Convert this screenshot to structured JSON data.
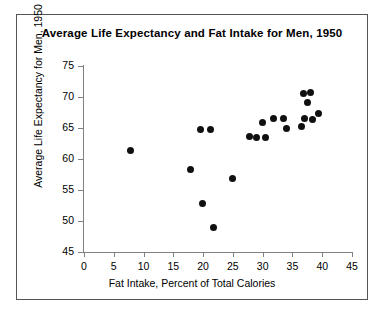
{
  "chart_data": {
    "type": "scatter",
    "title": "Average Life Expectancy and Fat Intake for Men, 1950",
    "xlabel": "Fat Intake, Percent of Total Calories",
    "ylabel": "Average Life Expectancy for Men, 1950",
    "xlim": [
      0,
      45
    ],
    "ylim": [
      45,
      75
    ],
    "xticks": [
      0,
      5,
      10,
      15,
      20,
      25,
      30,
      35,
      40,
      45
    ],
    "yticks": [
      45,
      50,
      55,
      60,
      65,
      70,
      75
    ],
    "grid": false,
    "legend": false,
    "marker_color": "#101010",
    "points": [
      {
        "x": 7.8,
        "y": 61.3
      },
      {
        "x": 17.9,
        "y": 58.3
      },
      {
        "x": 19.6,
        "y": 64.8
      },
      {
        "x": 21.3,
        "y": 64.8
      },
      {
        "x": 19.9,
        "y": 52.9
      },
      {
        "x": 21.7,
        "y": 48.9
      },
      {
        "x": 24.9,
        "y": 56.9
      },
      {
        "x": 27.8,
        "y": 63.6
      },
      {
        "x": 29.0,
        "y": 63.5
      },
      {
        "x": 30.4,
        "y": 63.4
      },
      {
        "x": 29.9,
        "y": 65.9
      },
      {
        "x": 31.9,
        "y": 66.6
      },
      {
        "x": 33.5,
        "y": 66.5
      },
      {
        "x": 34.0,
        "y": 64.9
      },
      {
        "x": 36.6,
        "y": 65.2
      },
      {
        "x": 36.8,
        "y": 70.6
      },
      {
        "x": 38.1,
        "y": 70.8
      },
      {
        "x": 37.6,
        "y": 69.1
      },
      {
        "x": 37.0,
        "y": 66.6
      },
      {
        "x": 38.4,
        "y": 66.4
      },
      {
        "x": 39.3,
        "y": 67.4
      }
    ]
  }
}
